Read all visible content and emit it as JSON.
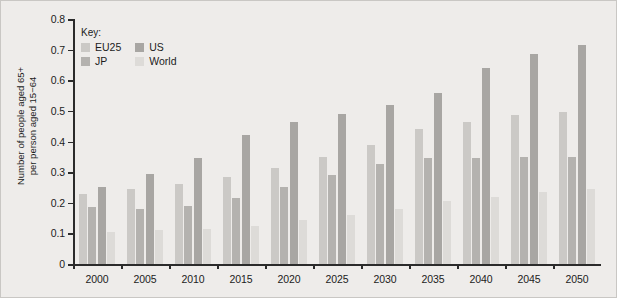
{
  "chart_data": {
    "type": "bar",
    "title": "",
    "xlabel": "",
    "ylabel": "Number of people aged 65+\nper person aged 15−64",
    "ylim": [
      0,
      0.8
    ],
    "ytick_labels": [
      "0",
      "0.1",
      "0.2",
      "0.3",
      "0.4",
      "0.5",
      "0.6",
      "0.7",
      "0.8"
    ],
    "ytick_values": [
      0,
      0.1,
      0.2,
      0.3,
      0.4,
      0.5,
      0.6,
      0.7,
      0.8
    ],
    "grid": false,
    "legend_position": "top-left",
    "legend_title": "Key:",
    "categories": [
      "2000",
      "2005",
      "2010",
      "2015",
      "2020",
      "2025",
      "2030",
      "2035",
      "2040",
      "2045",
      "2050"
    ],
    "series": [
      {
        "name": "EU25",
        "color": "#cbc9c6",
        "values": [
          0.23,
          0.245,
          0.26,
          0.285,
          0.315,
          0.35,
          0.39,
          0.44,
          0.465,
          0.485,
          0.495
        ]
      },
      {
        "name": "JP",
        "color": "#b4b2af",
        "values": [
          0.185,
          0.18,
          0.19,
          0.215,
          0.25,
          0.29,
          0.325,
          0.345,
          0.345,
          0.35,
          0.35
        ]
      },
      {
        "name": "US",
        "color": "#a8a6a3",
        "values": [
          0.25,
          0.295,
          0.345,
          0.42,
          0.465,
          0.49,
          0.52,
          0.56,
          0.64,
          0.685,
          0.715
        ]
      },
      {
        "name": "World",
        "color": "#dddbd8",
        "values": [
          0.105,
          0.11,
          0.115,
          0.125,
          0.145,
          0.16,
          0.18,
          0.205,
          0.22,
          0.235,
          0.245
        ]
      }
    ]
  },
  "legend": {
    "title": "Key:",
    "entries": [
      {
        "label": "EU25",
        "color": "#cbc9c6"
      },
      {
        "label": "US",
        "color": "#a8a6a3"
      },
      {
        "label": "JP",
        "color": "#b4b2af"
      },
      {
        "label": "World",
        "color": "#dddbd8"
      }
    ]
  },
  "axis": {
    "y_title": "Number of people aged 65+\nper person aged 15−64"
  }
}
